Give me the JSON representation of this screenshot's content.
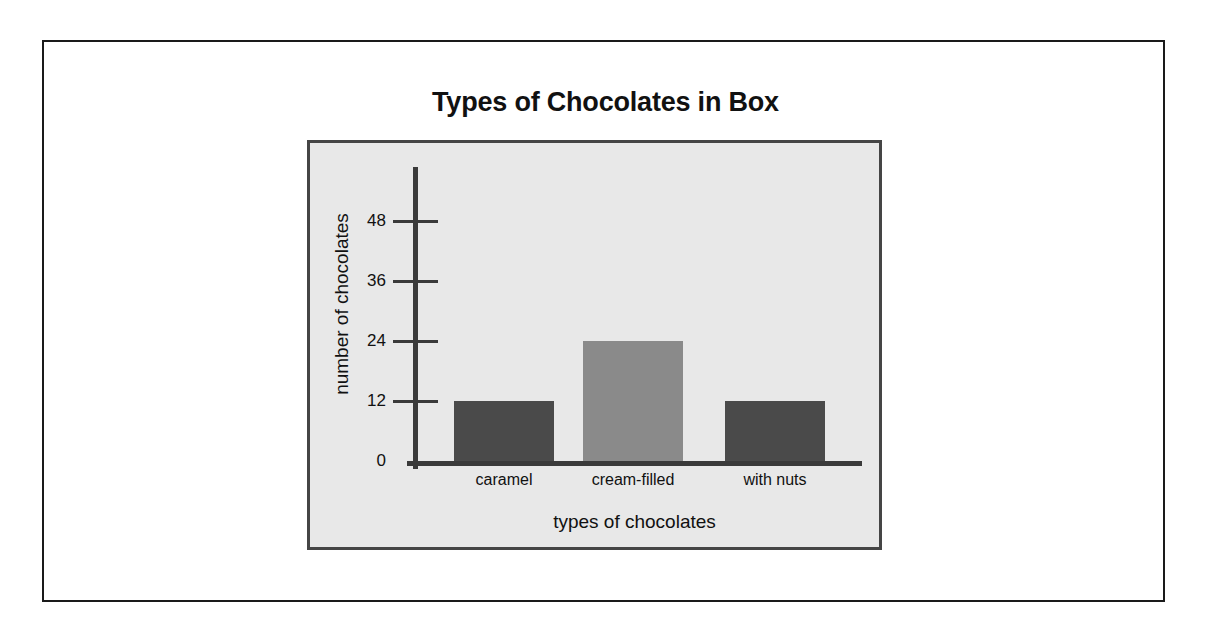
{
  "chart_data": {
    "type": "bar",
    "title": "Types of Chocolates in Box",
    "xlabel": "types of chocolates",
    "ylabel": "number of chocolates",
    "categories": [
      "caramel",
      "cream-filled",
      "with nuts"
    ],
    "values": [
      12,
      24,
      12
    ],
    "ylim": [
      0,
      48
    ],
    "yticks": [
      "0",
      "12",
      "24",
      "36",
      "48"
    ],
    "ytick_values": [
      0,
      12,
      24,
      36,
      48
    ],
    "grid": false,
    "legend": "none",
    "bar_colors": [
      "#4a4a4a",
      "#8a8a8a",
      "#4a4a4a"
    ],
    "plot_background": "#e8e8e8",
    "axis_color": "#3a3a3a",
    "frame_color": "#1a1a1a",
    "page_background": "#ffffff"
  }
}
